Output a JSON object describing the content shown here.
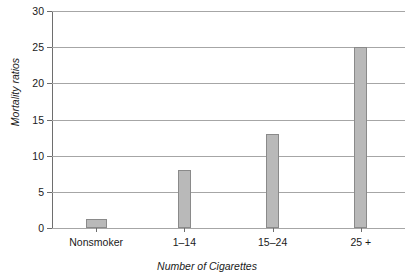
{
  "chart_data": {
    "type": "bar",
    "title": "",
    "categories": [
      "Nonsmoker",
      "1–14",
      "15–24",
      "25 +"
    ],
    "values": [
      1.3,
      8,
      13,
      25
    ],
    "xlabel": "Number of Cigarettes",
    "ylabel": "Mortality ratios",
    "ylim": [
      0,
      30
    ],
    "yticks": [
      0,
      5,
      10,
      15,
      20,
      25,
      30
    ],
    "ytick_labels": [
      "0",
      "5",
      "10",
      "15",
      "20",
      "25",
      "30"
    ],
    "grid": true,
    "legend": false,
    "legend_position": "none",
    "bar_color": "#b9b9b9",
    "bar_edge_color": "#8a8a8a",
    "gridline_color": "#a6a6a6",
    "axis_color": "#6e6e6e"
  }
}
